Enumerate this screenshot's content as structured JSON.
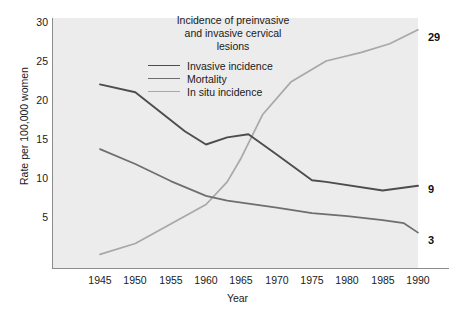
{
  "chart_data": {
    "type": "line",
    "title": "Incidence of preinvasive and invasive cervical lesions",
    "title_lines": [
      "Incidence of preinvasive",
      "and invasive cervical",
      "lesions"
    ],
    "xlabel": "Year",
    "ylabel": "Rate per 100,000 women",
    "xlim": [
      1943,
      1991
    ],
    "ylim": [
      0,
      31
    ],
    "xticks": [
      1945,
      1950,
      1955,
      1960,
      1965,
      1970,
      1975,
      1980,
      1985,
      1990
    ],
    "yticks": [
      5,
      10,
      15,
      20,
      25,
      30
    ],
    "grid": false,
    "legend_position": "upper center inside plot",
    "plot_background": "#ececec",
    "series": [
      {
        "name": "Invasive incidence",
        "color": "#4d4d4d",
        "end_label": "9",
        "x": [
          1945,
          1950,
          1957,
          1960,
          1963,
          1966,
          1970,
          1975,
          1977,
          1985,
          1990
        ],
        "values": [
          22.0,
          21.0,
          16.0,
          14.3,
          15.2,
          15.6,
          13.0,
          9.7,
          9.5,
          8.4,
          9.0
        ]
      },
      {
        "name": "Mortality",
        "color": "#6e6e6e",
        "end_label": "3",
        "x": [
          1945,
          1950,
          1955,
          1960,
          1963,
          1970,
          1975,
          1980,
          1985,
          1988,
          1990
        ],
        "values": [
          13.7,
          11.8,
          9.6,
          7.7,
          7.1,
          6.2,
          5.5,
          5.1,
          4.6,
          4.2,
          3.0
        ]
      },
      {
        "name": "In situ incidence",
        "color": "#a8a8a8",
        "end_label": "29",
        "x": [
          1945,
          1950,
          1955,
          1960,
          1963,
          1965,
          1968,
          1972,
          1977,
          1982,
          1986,
          1990
        ],
        "values": [
          0.2,
          1.6,
          4.1,
          6.6,
          9.5,
          12.6,
          18.1,
          22.3,
          25.0,
          26.1,
          27.2,
          29.0
        ]
      }
    ]
  },
  "axes": {
    "ytick_labels": [
      "30",
      "25",
      "20",
      "15",
      "10",
      "5"
    ],
    "xtick_labels": [
      "1945",
      "1950",
      "1955",
      "1960",
      "1965",
      "1970",
      "1975",
      "1980",
      "1985",
      "1990"
    ]
  },
  "legend": {
    "items": [
      {
        "label": "Invasive incidence",
        "color": "#4d4d4d"
      },
      {
        "label": "Mortality",
        "color": "#6e6e6e"
      },
      {
        "label": "In situ incidence",
        "color": "#a8a8a8"
      }
    ]
  },
  "end_labels": [
    {
      "name": "in-situ",
      "text": "29"
    },
    {
      "name": "invasive",
      "text": "9"
    },
    {
      "name": "mortality",
      "text": "3"
    }
  ]
}
